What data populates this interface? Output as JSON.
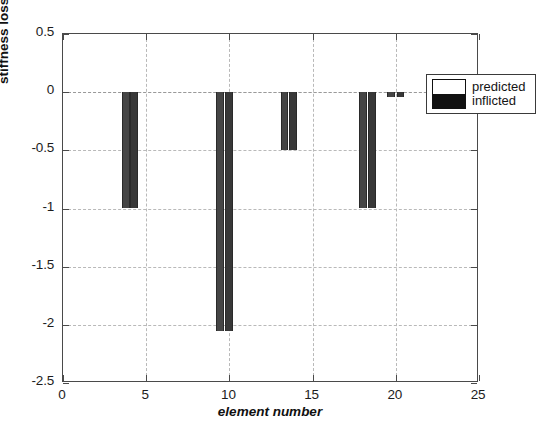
{
  "chart_data": {
    "type": "bar",
    "title": "",
    "xlabel": "element number",
    "ylabel": "stiffness loss Nm",
    "xlim": [
      0,
      25
    ],
    "ylim": [
      -2.5,
      0.5
    ],
    "xticks": [
      "0",
      "5",
      "10",
      "15",
      "20",
      "25"
    ],
    "xtick_values": [
      0,
      5,
      10,
      15,
      20,
      25
    ],
    "yticks": [
      "0.5",
      "0",
      "-0.5",
      "-1",
      "-1.5",
      "-2",
      "-2.5"
    ],
    "ytick_values": [
      0.5,
      0,
      -0.5,
      -1,
      -1.5,
      -2,
      -2.5
    ],
    "grid": true,
    "legend_position": "top-right",
    "categories": [
      4,
      9.7,
      13.6,
      18.3,
      20
    ],
    "series": [
      {
        "name": "predicted",
        "color": "#ffffff",
        "values": [
          -1.0,
          -2.05,
          -0.5,
          -1.0,
          -0.04
        ]
      },
      {
        "name": "inflicted",
        "color": "#111111",
        "values": [
          -1.0,
          -2.05,
          -0.5,
          -1.0,
          -0.04
        ]
      }
    ],
    "bars": [
      {
        "element": 4.0,
        "series": "predicted",
        "value": -1.0,
        "x0": 3.55,
        "x1": 4.0
      },
      {
        "element": 4.0,
        "series": "inflicted",
        "value": -1.0,
        "x0": 4.05,
        "x1": 4.5
      },
      {
        "element": 9.7,
        "series": "predicted",
        "value": -2.05,
        "x0": 9.2,
        "x1": 9.65
      },
      {
        "element": 9.7,
        "series": "inflicted",
        "value": -2.05,
        "x0": 9.75,
        "x1": 10.2
      },
      {
        "element": 13.6,
        "series": "predicted",
        "value": -0.5,
        "x0": 13.1,
        "x1": 13.5
      },
      {
        "element": 13.6,
        "series": "inflicted",
        "value": -0.5,
        "x0": 13.6,
        "x1": 14.05
      },
      {
        "element": 18.3,
        "series": "predicted",
        "value": -1.0,
        "x0": 17.8,
        "x1": 18.25
      },
      {
        "element": 18.3,
        "series": "inflicted",
        "value": -1.0,
        "x0": 18.35,
        "x1": 18.8
      },
      {
        "element": 20.0,
        "series": "predicted",
        "value": -0.04,
        "x0": 19.5,
        "x1": 19.95
      },
      {
        "element": 20.0,
        "series": "inflicted",
        "value": -0.04,
        "x0": 20.05,
        "x1": 20.5
      }
    ]
  },
  "legend": {
    "entries": [
      {
        "label": "predicted"
      },
      {
        "label": "inflicted"
      }
    ]
  },
  "axes": {
    "y_title": "stiffness loss Nm",
    "x_title": "element number"
  }
}
